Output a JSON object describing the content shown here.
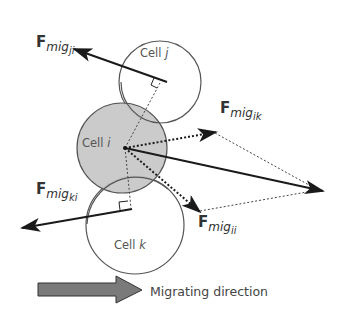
{
  "diagram": {
    "cells": [
      {
        "id": "j",
        "label_prefix": "Cell ",
        "label_var": "j",
        "fill": "#ffffff"
      },
      {
        "id": "i",
        "label_prefix": "Cell ",
        "label_var": "i",
        "fill": "#c8c8c8"
      },
      {
        "id": "k",
        "label_prefix": "Cell ",
        "label_var": "k",
        "fill": "#ffffff"
      }
    ],
    "forces": [
      {
        "id": "ji",
        "base": "F",
        "sub": "mig",
        "subsub": "ji",
        "style": "solid"
      },
      {
        "id": "ik",
        "base": "F",
        "sub": "mig",
        "subsub": "ik",
        "style": "dotted"
      },
      {
        "id": "ki",
        "base": "F",
        "sub": "mig",
        "subsub": "ki",
        "style": "solid"
      },
      {
        "id": "ii",
        "base": "F",
        "sub": "mig",
        "subsub": "ii",
        "style": "dotted"
      }
    ],
    "legend": {
      "label": "Migrating direction",
      "arrow_color": "#7a7a7a"
    },
    "colors": {
      "line": "#222222",
      "circle_stroke": "#555555",
      "cell_i_fill": "#c8c8c8"
    }
  }
}
